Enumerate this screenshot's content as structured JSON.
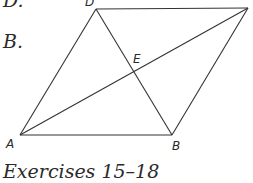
{
  "fragments": {
    "top": "D.",
    "second": "B."
  },
  "figure": {
    "vertices": [
      {
        "name": "A",
        "x": 20,
        "y": 135,
        "label": "A"
      },
      {
        "name": "B",
        "x": 172,
        "y": 135,
        "label": "B"
      },
      {
        "name": "C",
        "x": 248,
        "y": 8,
        "label": ""
      },
      {
        "name": "D",
        "x": 96,
        "y": 9,
        "label": "D"
      },
      {
        "name": "E",
        "x": 134,
        "y": 72,
        "label": "E"
      }
    ],
    "line_color": "#333333"
  },
  "caption": "Exercises 15–18"
}
